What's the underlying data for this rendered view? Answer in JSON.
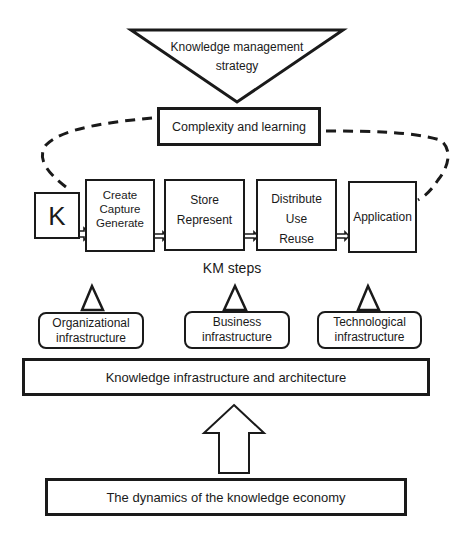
{
  "strategy": {
    "line1": "Knowledge management",
    "line2": "strategy"
  },
  "complexity": {
    "label": "Complexity and learning"
  },
  "knowledge_symbol": {
    "label": "K"
  },
  "km_steps": {
    "caption": "KM steps",
    "steps": [
      {
        "lines": [
          "Create",
          "Capture",
          "Generate"
        ]
      },
      {
        "lines": [
          "Store",
          "Represent"
        ]
      },
      {
        "lines": [
          "Distribute",
          "Use",
          "Reuse"
        ]
      },
      {
        "lines": [
          "Application"
        ]
      }
    ]
  },
  "infrastructures": [
    {
      "line1": "Organizational",
      "line2": "infrastructure"
    },
    {
      "line1": "Business",
      "line2": "infrastructure"
    },
    {
      "line1": "Technological",
      "line2": "infrastructure"
    }
  ],
  "architecture": {
    "label": "Knowledge infrastructure and architecture"
  },
  "economy": {
    "label": "The dynamics of the knowledge economy"
  },
  "colors": {
    "stroke": "#1a1a1a",
    "background": "#ffffff"
  }
}
